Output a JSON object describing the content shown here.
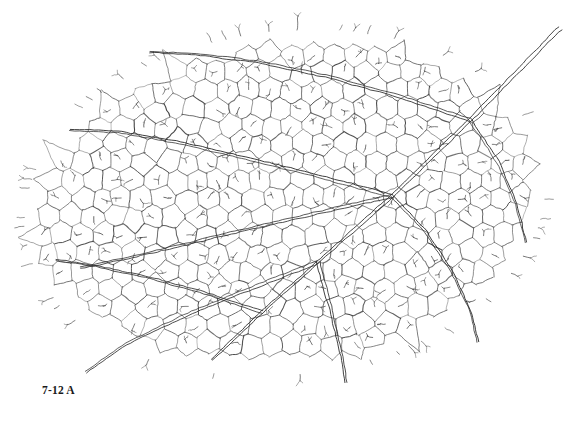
{
  "figure": {
    "caption": "7-12 A",
    "background_color": "#ffffff",
    "line_color": "#3c3c3c",
    "minor_line_color": "#5a5a5a",
    "major_line_color": "#2e2e2e",
    "canvas": {
      "width": 577,
      "height": 422
    },
    "blade": {
      "center_x": 285,
      "center_y": 203,
      "radius_x": 262,
      "radius_y": 172,
      "rotation_deg": -7
    },
    "major_veins": [
      {
        "name": "midvein-primary",
        "points": [
          [
            560,
            28
          ],
          [
            470,
            120
          ],
          [
            392,
            196
          ],
          [
            318,
            262
          ],
          [
            262,
            312
          ],
          [
            212,
            360
          ]
        ],
        "width": 2.0
      },
      {
        "name": "secondary-lower-left",
        "points": [
          [
            318,
            262
          ],
          [
            252,
            288
          ],
          [
            188,
            314
          ],
          [
            126,
            344
          ],
          [
            86,
            372
          ]
        ],
        "width": 1.7
      },
      {
        "name": "secondary-lower-right",
        "points": [
          [
            318,
            262
          ],
          [
            330,
            306
          ],
          [
            340,
            348
          ],
          [
            346,
            382
          ]
        ],
        "width": 1.7
      },
      {
        "name": "secondary-left-upper",
        "points": [
          [
            392,
            196
          ],
          [
            318,
            176
          ],
          [
            246,
            158
          ],
          [
            176,
            142
          ],
          [
            118,
            132
          ],
          [
            70,
            130
          ]
        ],
        "width": 1.6
      },
      {
        "name": "secondary-left-mid",
        "points": [
          [
            392,
            196
          ],
          [
            322,
            212
          ],
          [
            252,
            228
          ],
          [
            186,
            244
          ],
          [
            128,
            258
          ],
          [
            80,
            268
          ]
        ],
        "width": 1.5
      },
      {
        "name": "secondary-upper-left",
        "points": [
          [
            470,
            120
          ],
          [
            398,
            96
          ],
          [
            326,
            76
          ],
          [
            258,
            62
          ],
          [
            196,
            54
          ],
          [
            150,
            52
          ]
        ],
        "width": 1.5
      },
      {
        "name": "secondary-right-branch",
        "points": [
          [
            470,
            120
          ],
          [
            498,
            162
          ],
          [
            516,
            204
          ],
          [
            526,
            242
          ]
        ],
        "width": 1.4
      },
      {
        "name": "tertiary-left-lower",
        "points": [
          [
            262,
            312
          ],
          [
            208,
            294
          ],
          [
            150,
            278
          ],
          [
            96,
            266
          ],
          [
            56,
            260
          ]
        ],
        "width": 1.3
      },
      {
        "name": "tertiary-right-lower",
        "points": [
          [
            392,
            196
          ],
          [
            426,
            232
          ],
          [
            452,
            272
          ],
          [
            470,
            310
          ],
          [
            478,
            342
          ]
        ],
        "width": 1.3
      }
    ],
    "areole_count_estimate": 260,
    "veinlet_count_estimate": 190
  }
}
